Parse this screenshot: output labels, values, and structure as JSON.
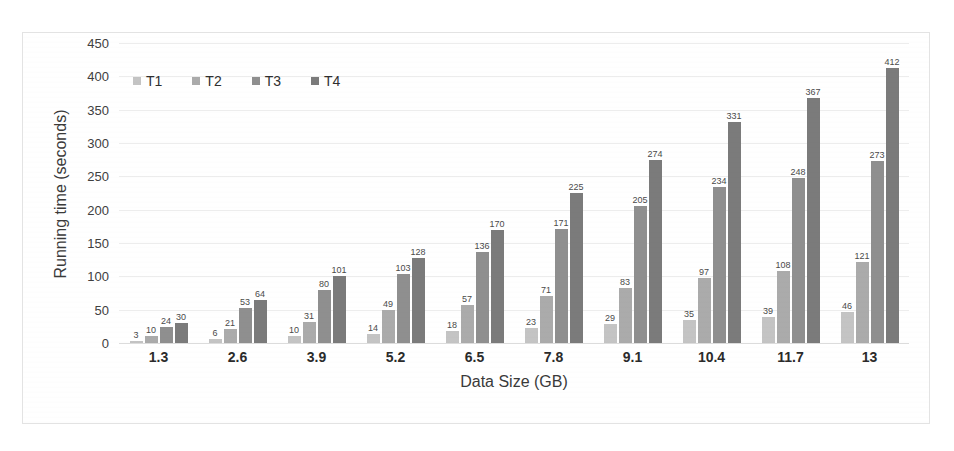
{
  "chart_data": {
    "type": "bar",
    "title": "",
    "xlabel": "Data Size (GB)",
    "ylabel": "Running time (seconds)",
    "categories": [
      "1.3",
      "2.6",
      "3.9",
      "5.2",
      "6.5",
      "7.8",
      "9.1",
      "10.4",
      "11.7",
      "13"
    ],
    "series": [
      {
        "name": "T1",
        "color": "#c4c4c4",
        "values": [
          3,
          6,
          10,
          14,
          18,
          23,
          29,
          35,
          39,
          46
        ]
      },
      {
        "name": "T2",
        "color": "#ababab",
        "values": [
          10,
          21,
          31,
          49,
          57,
          71,
          83,
          97,
          108,
          121
        ]
      },
      {
        "name": "T3",
        "color": "#8f8f8f",
        "values": [
          24,
          53,
          80,
          103,
          136,
          171,
          205,
          234,
          248,
          273
        ]
      },
      {
        "name": "T4",
        "color": "#7b7b7b",
        "values": [
          30,
          64,
          101,
          128,
          170,
          225,
          274,
          331,
          367,
          412
        ]
      }
    ],
    "ylim": [
      0,
      450
    ],
    "ytick_step": 50,
    "yticks": [
      "450",
      "400",
      "350",
      "300",
      "250",
      "200",
      "150",
      "100",
      "50",
      "0"
    ],
    "grid": true,
    "legend_position": "top-left-inside",
    "show_data_labels": true
  }
}
